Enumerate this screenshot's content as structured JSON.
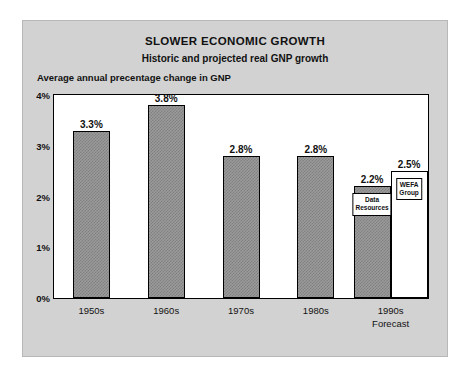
{
  "chart_data": {
    "type": "bar",
    "title": "SLOWER ECONOMIC GROWTH",
    "subtitle": "Historic and projected real GNP growth",
    "ylabel": "Average annual precentage change in GNP",
    "xlabel": "",
    "ylim": [
      0,
      4
    ],
    "ytick_labels": [
      "0%",
      "1%",
      "2%",
      "3%",
      "4%"
    ],
    "ytick_values": [
      0,
      1,
      2,
      3,
      4
    ],
    "grid": false,
    "legend": "none",
    "categories": [
      "1950s",
      "1960s",
      "1970s",
      "1980s",
      "1990s"
    ],
    "category_sublabels": [
      "",
      "",
      "",
      "",
      "Forecast"
    ],
    "bars": [
      {
        "category": "1950s",
        "label": "3.3%",
        "value": 3.3,
        "fill": "hatch",
        "tag": ""
      },
      {
        "category": "1960s",
        "label": "3.8%",
        "value": 3.8,
        "fill": "hatch",
        "tag": ""
      },
      {
        "category": "1970s",
        "label": "2.8%",
        "value": 2.8,
        "fill": "hatch",
        "tag": ""
      },
      {
        "category": "1980s",
        "label": "2.8%",
        "value": 2.8,
        "fill": "hatch",
        "tag": ""
      },
      {
        "category": "1990s",
        "label": "2.2%",
        "value": 2.2,
        "fill": "hatch",
        "tag": "Data\nResources"
      },
      {
        "category": "1990s",
        "label": "2.5%",
        "value": 2.5,
        "fill": "white",
        "tag": "WEFA\nGroup"
      }
    ],
    "colors": {
      "card_background": "#d2d2d2",
      "plot_background": "#ffffff",
      "bar_hatch": "#9a9a9a",
      "bar_white": "#ffffff",
      "outline": "#000000",
      "text": "#111111"
    }
  }
}
